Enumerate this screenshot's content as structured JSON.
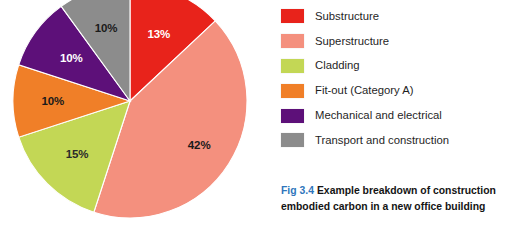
{
  "figure": {
    "caption_number": "Fig 3.4",
    "caption_text": "Example breakdown of construction embodied carbon in a new office building",
    "caption_number_color": "#2f76bc"
  },
  "chart_data": {
    "type": "pie",
    "title": "Example breakdown of construction embodied carbon in a new office building",
    "xlabel": "",
    "ylabel": "",
    "units": "percent",
    "start_angle_deg": 0,
    "direction": "clockwise",
    "legend_position": "right",
    "grid": false,
    "categories": [
      "Substructure",
      "Superstructure",
      "Cladding",
      "Fit-out (Category A)",
      "Mechanical and electrical",
      "Transport and construction"
    ],
    "values": [
      13,
      42,
      15,
      10,
      10,
      10
    ],
    "labels": [
      "13%",
      "42%",
      "15%",
      "10%",
      "10%",
      "10%"
    ],
    "colors": [
      "#e8231b",
      "#f4907e",
      "#c3d755",
      "#f07f28",
      "#5d1079",
      "#8c8c8c"
    ],
    "label_colors": [
      "#ffffff",
      "#1a1a1a",
      "#2a2a2a",
      "#1a1a1a",
      "#ffffff",
      "#1a1a1a"
    ],
    "slices": [
      {
        "name": "Substructure",
        "value": 13,
        "label": "13%",
        "color": "#e8231b",
        "label_color": "#ffffff"
      },
      {
        "name": "Superstructure",
        "value": 42,
        "label": "42%",
        "color": "#f4907e",
        "label_color": "#1a1a1a"
      },
      {
        "name": "Cladding",
        "value": 15,
        "label": "15%",
        "color": "#c3d755",
        "label_color": "#2a2a2a"
      },
      {
        "name": "Fit-out (Category A)",
        "value": 10,
        "label": "10%",
        "color": "#f07f28",
        "label_color": "#1a1a1a"
      },
      {
        "name": "Mechanical and electrical",
        "value": 10,
        "label": "10%",
        "color": "#5d1079",
        "label_color": "#ffffff"
      },
      {
        "name": "Transport and construction",
        "value": 10,
        "label": "10%",
        "color": "#8c8c8c",
        "label_color": "#1a1a1a"
      }
    ]
  },
  "legend": {
    "items": [
      {
        "label": "Substructure",
        "color": "#e8231b"
      },
      {
        "label": "Superstructure",
        "color": "#f4907e"
      },
      {
        "label": "Cladding",
        "color": "#c3d755"
      },
      {
        "label": "Fit-out (Category A)",
        "color": "#f07f28"
      },
      {
        "label": "Mechanical and electrical",
        "color": "#5d1079"
      },
      {
        "label": "Transport and construction",
        "color": "#8c8c8c"
      }
    ]
  }
}
